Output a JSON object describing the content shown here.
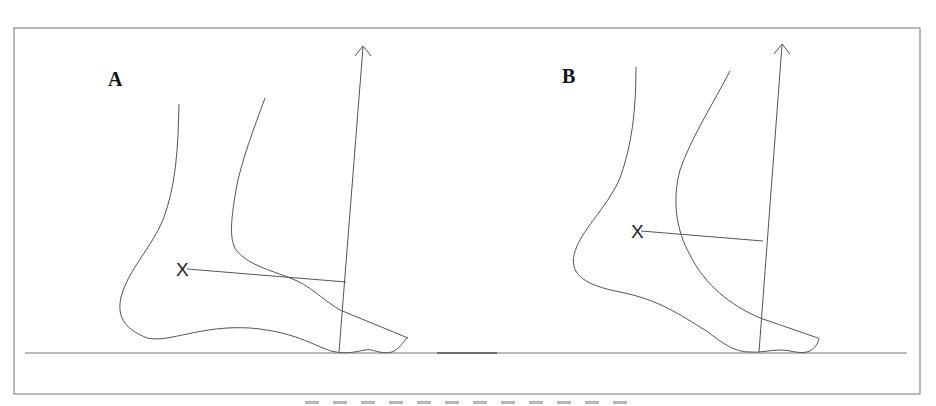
{
  "figure": {
    "panels": [
      {
        "id": "A",
        "label": "A",
        "marker": "X",
        "description": "Foot in plantigrade position with vertical reference arrow and perpendicular line from ankle axis marker"
      },
      {
        "id": "B",
        "label": "B",
        "marker": "X",
        "description": "Foot in plantarflexed position with vertical reference arrow and perpendicular line from ankle axis marker"
      }
    ],
    "colors": {
      "line": "#555555",
      "frame": "#8a8a8a",
      "label": "#111111",
      "background": "#ffffff"
    }
  }
}
